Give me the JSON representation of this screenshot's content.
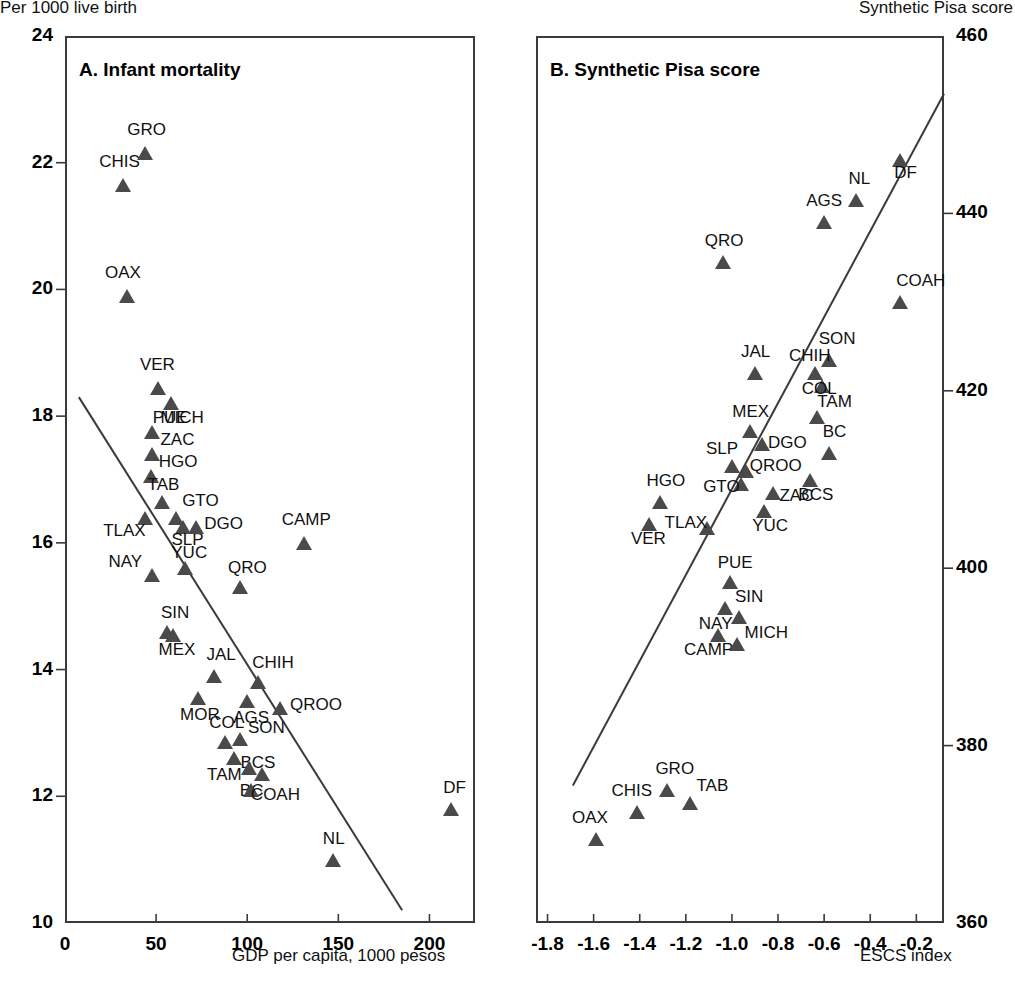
{
  "header": {
    "left_axis_caption": "Per 1000 live birth",
    "right_axis_caption": "Synthetic Pisa score"
  },
  "panels": {
    "a": {
      "title": "A. Infant mortality",
      "xlabel": "GDP per capita, 1000 pesos",
      "ylabel": "Per 1000 live birth",
      "yticks": [
        "24",
        "22",
        "20",
        "18",
        "16",
        "14",
        "12",
        "10"
      ],
      "xticks": [
        "0",
        "50",
        "100",
        "150",
        "200"
      ]
    },
    "b": {
      "title": "B. Synthetic Pisa score",
      "xlabel": "ESCS index",
      "ylabel": "Synthetic Pisa score",
      "yticks": [
        "460",
        "440",
        "420",
        "400",
        "380",
        "360"
      ],
      "xticks": [
        "-1.8",
        "-1.6",
        "-1.4",
        "-1.2",
        "-1.0",
        "-0.8",
        "-0.6",
        "-0.4",
        "-0.2"
      ]
    }
  },
  "chart_data": [
    {
      "type": "scatter",
      "panel": "A",
      "title": "A. Infant mortality",
      "xlabel": "GDP per capita, 1000 pesos",
      "ylabel": "Per 1000 live birth",
      "xlim": [
        0,
        225
      ],
      "ylim": [
        10,
        24
      ],
      "xticks": [
        0,
        50,
        100,
        150,
        200
      ],
      "yticks": [
        10,
        12,
        14,
        16,
        18,
        20,
        22,
        24
      ],
      "grid": false,
      "legend": "none",
      "trendline": {
        "x0": 7.6,
        "y0": 18.3,
        "x1": 185.0,
        "y1": 10.2
      },
      "points": [
        {
          "label": "GRO",
          "x": 44,
          "y": 22.15
        },
        {
          "label": "CHIS",
          "x": 32,
          "y": 21.65
        },
        {
          "label": "OAX",
          "x": 34,
          "y": 19.9
        },
        {
          "label": "VER",
          "x": 51,
          "y": 18.45
        },
        {
          "label": "PUE",
          "x": 58,
          "y": 18.2
        },
        {
          "label": "MICH",
          "x": 48,
          "y": 17.75
        },
        {
          "label": "ZAC",
          "x": 48,
          "y": 17.4
        },
        {
          "label": "HGO",
          "x": 47,
          "y": 17.05
        },
        {
          "label": "TAB",
          "x": 53,
          "y": 16.65
        },
        {
          "label": "TLAX",
          "x": 44,
          "y": 16.4
        },
        {
          "label": "GTO",
          "x": 61,
          "y": 16.4
        },
        {
          "label": "SLP",
          "x": 65,
          "y": 16.25
        },
        {
          "label": "DGO",
          "x": 72,
          "y": 16.25
        },
        {
          "label": "NAY",
          "x": 48,
          "y": 15.5
        },
        {
          "label": "YUC",
          "x": 66,
          "y": 15.6
        },
        {
          "label": "CAMP",
          "x": 131,
          "y": 16.0
        },
        {
          "label": "QRO",
          "x": 96,
          "y": 15.3
        },
        {
          "label": "SIN",
          "x": 56,
          "y": 14.6
        },
        {
          "label": "MEX",
          "x": 59,
          "y": 14.55
        },
        {
          "label": "JAL",
          "x": 82,
          "y": 13.9
        },
        {
          "label": "CHIH",
          "x": 106,
          "y": 13.8
        },
        {
          "label": "MOR",
          "x": 73,
          "y": 13.55
        },
        {
          "label": "AGS",
          "x": 100,
          "y": 13.5
        },
        {
          "label": "QROO",
          "x": 118,
          "y": 13.4
        },
        {
          "label": "COL",
          "x": 88,
          "y": 12.85
        },
        {
          "label": "SON",
          "x": 96,
          "y": 12.9
        },
        {
          "label": "BCS",
          "x": 93,
          "y": 12.6
        },
        {
          "label": "TAM",
          "x": 101,
          "y": 12.45
        },
        {
          "label": "BC",
          "x": 108,
          "y": 12.35
        },
        {
          "label": "COAH",
          "x": 102,
          "y": 12.1
        },
        {
          "label": "DF",
          "x": 212,
          "y": 11.8
        },
        {
          "label": "NL",
          "x": 147,
          "y": 11.0
        }
      ]
    },
    {
      "type": "scatter",
      "panel": "B",
      "title": "B. Synthetic Pisa score",
      "xlabel": "ESCS index",
      "ylabel": "Synthetic Pisa score",
      "xlim": [
        -1.85,
        -0.08
      ],
      "ylim": [
        360,
        460
      ],
      "xticks": [
        -1.8,
        -1.6,
        -1.4,
        -1.2,
        -1.0,
        -0.8,
        -0.6,
        -0.4,
        -0.2
      ],
      "yticks": [
        360,
        380,
        400,
        420,
        440,
        460
      ],
      "grid": false,
      "legend": "none",
      "trendline": {
        "x0": -1.69,
        "y0": 375.5,
        "x1": -0.08,
        "y1": 453.5
      },
      "points": [
        {
          "label": "DF",
          "x": -0.27,
          "y": 446.0
        },
        {
          "label": "NL",
          "x": -0.46,
          "y": 441.5
        },
        {
          "label": "AGS",
          "x": -0.6,
          "y": 439.0
        },
        {
          "label": "COAH",
          "x": -0.27,
          "y": 430.0
        },
        {
          "label": "QRO",
          "x": -1.04,
          "y": 434.5
        },
        {
          "label": "SON",
          "x": -0.58,
          "y": 423.5
        },
        {
          "label": "CHIH",
          "x": -0.64,
          "y": 422.0
        },
        {
          "label": "JAL",
          "x": -0.9,
          "y": 422.0
        },
        {
          "label": "COL",
          "x": -0.61,
          "y": 420.5
        },
        {
          "label": "TAM",
          "x": -0.63,
          "y": 417.0
        },
        {
          "label": "MEX",
          "x": -0.92,
          "y": 415.5
        },
        {
          "label": "DGO",
          "x": -0.87,
          "y": 414.0
        },
        {
          "label": "BC",
          "x": -0.58,
          "y": 413.0
        },
        {
          "label": "SLP",
          "x": -1.0,
          "y": 411.5
        },
        {
          "label": "QROO",
          "x": -0.94,
          "y": 411.0
        },
        {
          "label": "GTO",
          "x": -0.96,
          "y": 409.5
        },
        {
          "label": "BCS",
          "x": -0.66,
          "y": 410.0
        },
        {
          "label": "ZAC",
          "x": -0.82,
          "y": 408.5
        },
        {
          "label": "YUC",
          "x": -0.86,
          "y": 406.5
        },
        {
          "label": "HGO",
          "x": -1.31,
          "y": 407.5
        },
        {
          "label": "VER",
          "x": -1.36,
          "y": 405.0
        },
        {
          "label": "TLAX",
          "x": -1.11,
          "y": 404.5
        },
        {
          "label": "PUE",
          "x": -1.01,
          "y": 398.5
        },
        {
          "label": "SIN",
          "x": -1.03,
          "y": 395.5
        },
        {
          "label": "NAY",
          "x": -0.97,
          "y": 394.5
        },
        {
          "label": "CAMP",
          "x": -1.06,
          "y": 392.5
        },
        {
          "label": "MICH",
          "x": -0.98,
          "y": 391.5
        },
        {
          "label": "GRO",
          "x": -1.28,
          "y": 375.0
        },
        {
          "label": "TAB",
          "x": -1.18,
          "y": 373.5
        },
        {
          "label": "CHIS",
          "x": -1.41,
          "y": 372.5
        },
        {
          "label": "OAX",
          "x": -1.59,
          "y": 369.5
        }
      ]
    }
  ],
  "point_labels_a": {
    "GRO": {
      "dx": -18,
      "dy": -32
    },
    "CHIS": {
      "dx": -24,
      "dy": -32
    },
    "OAX": {
      "dx": -22,
      "dy": -32
    },
    "VER": {
      "dx": -18,
      "dy": -32
    },
    "PUE": {
      "dx": -18,
      "dy": 6
    },
    "MICH": {
      "dx": 8,
      "dy": -23
    },
    "ZAC": {
      "dx": 8,
      "dy": -23
    },
    "HGO": {
      "dx": 8,
      "dy": -23
    },
    "TAB": {
      "dx": -14,
      "dy": -26
    },
    "TLAX": {
      "dx": -42,
      "dy": 4
    },
    "GTO": {
      "dx": 6,
      "dy": -26
    },
    "SLP": {
      "dx": -12,
      "dy": 4
    },
    "DGO": {
      "dx": 8,
      "dy": -12
    },
    "NAY": {
      "dx": -44,
      "dy": -22
    },
    "YUC": {
      "dx": -14,
      "dy": -24
    },
    "CAMP": {
      "dx": -22,
      "dy": -32
    },
    "QRO": {
      "dx": -12,
      "dy": -28
    },
    "SIN": {
      "dx": -6,
      "dy": -28
    },
    "MEX": {
      "dx": -14,
      "dy": 6
    },
    "JAL": {
      "dx": -8,
      "dy": -30
    },
    "CHIH": {
      "dx": -6,
      "dy": -28
    },
    "MOR": {
      "dx": -18,
      "dy": 8
    },
    "AGS": {
      "dx": -14,
      "dy": 8
    },
    "QROO": {
      "dx": 10,
      "dy": -12
    },
    "COL": {
      "dx": -16,
      "dy": -28
    },
    "SON": {
      "dx": 8,
      "dy": -20
    },
    "BCS": {
      "dx": 6,
      "dy": -4
    },
    "TAM": {
      "dx": -42,
      "dy": -2
    },
    "BC": {
      "dx": -22,
      "dy": 8
    },
    "COAH": {
      "dx": 0,
      "dy": -4
    },
    "DF": {
      "dx": -8,
      "dy": -30
    },
    "NL": {
      "dx": -10,
      "dy": -30
    }
  },
  "point_labels_b": {
    "DF": {
      "dx": -6,
      "dy": 4
    },
    "NL": {
      "dx": -8,
      "dy": -30
    },
    "AGS": {
      "dx": -18,
      "dy": -30
    },
    "COAH": {
      "dx": -4,
      "dy": -30
    },
    "QRO": {
      "dx": -18,
      "dy": -30
    },
    "SON": {
      "dx": -10,
      "dy": -30
    },
    "CHIH": {
      "dx": -26,
      "dy": -26
    },
    "JAL": {
      "dx": -14,
      "dy": -30
    },
    "COL": {
      "dx": -20,
      "dy": -6
    },
    "TAM": {
      "dx": 0,
      "dy": -24
    },
    "MEX": {
      "dx": -18,
      "dy": -28
    },
    "DGO": {
      "dx": 6,
      "dy": -10
    },
    "BC": {
      "dx": -6,
      "dy": -30
    },
    "SLP": {
      "dx": -26,
      "dy": -26
    },
    "QROO": {
      "dx": 4,
      "dy": -14
    },
    "GTO": {
      "dx": -38,
      "dy": -6
    },
    "BCS": {
      "dx": -12,
      "dy": 6
    },
    "ZAC": {
      "dx": 6,
      "dy": -6
    },
    "YUC": {
      "dx": -12,
      "dy": 6
    },
    "HGO": {
      "dx": -14,
      "dy": -30
    },
    "VER": {
      "dx": -18,
      "dy": 6
    },
    "TLAX": {
      "dx": -42,
      "dy": -14
    },
    "PUE": {
      "dx": -12,
      "dy": -28
    },
    "SIN": {
      "dx": 10,
      "dy": -20
    },
    "NAY": {
      "dx": -40,
      "dy": -2
    },
    "CAMP": {
      "dx": -34,
      "dy": 6
    },
    "MICH": {
      "dx": 8,
      "dy": -20
    },
    "GRO": {
      "dx": -12,
      "dy": -30
    },
    "TAB": {
      "dx": 6,
      "dy": -26
    },
    "CHIS": {
      "dx": -26,
      "dy": -30
    },
    "OAX": {
      "dx": -24,
      "dy": -30
    }
  },
  "style": {
    "marker_color": "#4a4a4a",
    "frame_color": "#3a3a3a",
    "text_color": "#111111"
  }
}
